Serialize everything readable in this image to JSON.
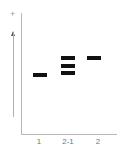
{
  "diagram": {
    "polarity_symbol": "+",
    "direction_arrow": "migration-direction-up",
    "lanes": [
      {
        "label": "1",
        "bands": [
          {
            "y": 73
          }
        ]
      },
      {
        "label": "2-1",
        "bands": [
          {
            "y": 56
          },
          {
            "y": 64
          },
          {
            "y": 71
          }
        ]
      },
      {
        "label": "2",
        "bands": [
          {
            "y": 56
          }
        ]
      }
    ],
    "colors": {
      "band": "#111111",
      "axis": "#b8b8b8",
      "label": "#777777"
    }
  }
}
